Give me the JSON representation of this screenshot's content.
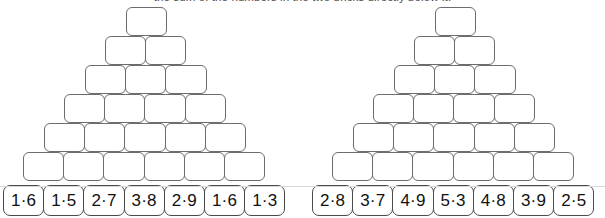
{
  "worksheet": {
    "instruction": "the sum of the numbers in the two bricks directly below it.",
    "pyramids": [
      {
        "id": "left-pyramid",
        "rows": [
          {
            "blocks": [
              "",
              ""
            ]
          },
          {
            "blocks": [
              "",
              "",
              ""
            ]
          },
          {
            "blocks": [
              "",
              "",
              "",
              ""
            ]
          },
          {
            "blocks": [
              "",
              "",
              "",
              "",
              ""
            ]
          },
          {
            "blocks": [
              "",
              "",
              "",
              "",
              "",
              ""
            ]
          },
          {
            "blocks": [
              "",
              "",
              "",
              "",
              "",
              "",
              ""
            ]
          },
          {
            "blocks": [
              "",
              "",
              "",
              "",
              "",
              "",
              ""
            ]
          }
        ],
        "top_block": "",
        "bottom_row": [
          "1·6",
          "1·5",
          "2·7",
          "3·8",
          "2·9",
          "1·6",
          "1·3"
        ]
      },
      {
        "id": "right-pyramid",
        "rows": [
          {
            "blocks": [
              "",
              ""
            ]
          },
          {
            "blocks": [
              "",
              "",
              ""
            ]
          },
          {
            "blocks": [
              "",
              "",
              "",
              ""
            ]
          },
          {
            "blocks": [
              "",
              "",
              "",
              "",
              ""
            ]
          },
          {
            "blocks": [
              "",
              "",
              "",
              "",
              "",
              ""
            ]
          },
          {
            "blocks": [
              "",
              "",
              "",
              "",
              "",
              "",
              ""
            ]
          },
          {
            "blocks": [
              "",
              "",
              "",
              "",
              "",
              "",
              ""
            ]
          }
        ],
        "top_block": "",
        "bottom_row": [
          "2·8",
          "3·7",
          "4·9",
          "5·3",
          "4·8",
          "3·9",
          "2·5"
        ]
      }
    ],
    "colors": {
      "block_border": "#6c6c6c",
      "answer_border": "#4a4a4a",
      "background": "#ffffff",
      "text": "#111111"
    }
  }
}
